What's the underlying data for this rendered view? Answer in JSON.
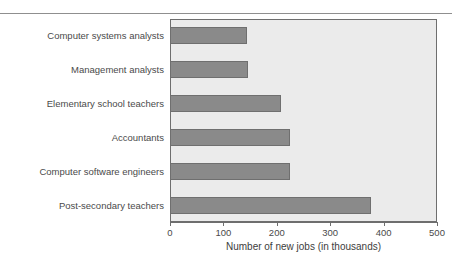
{
  "chart_data": {
    "type": "bar",
    "orientation": "horizontal",
    "title": "",
    "xlabel": "Number of new jobs (in thousands)",
    "ylabel": "",
    "categories": [
      "Computer systems analysts",
      "Management analysts",
      "Elementary school teachers",
      "Accountants",
      "Computer software engineers",
      "Post-secondary teachers"
    ],
    "values": [
      144,
      146,
      208,
      225,
      225,
      376
    ],
    "xlim": [
      0,
      500
    ],
    "xticks": [
      0,
      100,
      200,
      300,
      400,
      500
    ],
    "xtick_labels": [
      "0",
      "100",
      "200",
      "300",
      "400",
      "500"
    ],
    "grid": false,
    "legend": null,
    "colors": {
      "bar_fill": "#8a8a8a",
      "bar_border": "#6f6f6f",
      "plot_background": "#ebebeb",
      "axis": "#6e6e6e",
      "text": "#4a4a4a",
      "rule": "#8f8f8f",
      "page_background": "#ffffff"
    }
  }
}
